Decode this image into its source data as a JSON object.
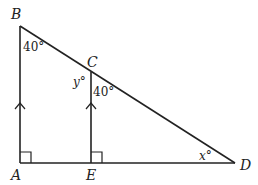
{
  "diagram": {
    "type": "geometry-triangle",
    "points": {
      "A": {
        "label": "A",
        "x": 20,
        "y": 163
      },
      "B": {
        "label": "B",
        "x": 20,
        "y": 26
      },
      "C": {
        "label": "C",
        "x": 91,
        "y": 72
      },
      "D": {
        "label": "D",
        "x": 235,
        "y": 163
      },
      "E": {
        "label": "E",
        "x": 91,
        "y": 163
      }
    },
    "segments": [
      "AB",
      "BD",
      "AD",
      "CE"
    ],
    "angles": {
      "angle_B": {
        "text": "40°",
        "at": "B"
      },
      "angle_C_upper": {
        "text": "y°",
        "at": "C",
        "note": "left of CE"
      },
      "angle_C_lower": {
        "text": "40°",
        "at": "C",
        "note": "right of CE"
      },
      "angle_D": {
        "text": "x°",
        "at": "D"
      }
    },
    "right_angle_markers": [
      "A",
      "E"
    ],
    "parallel_markers": [
      "AB",
      "EC"
    ],
    "stroke_color": "#222222"
  }
}
